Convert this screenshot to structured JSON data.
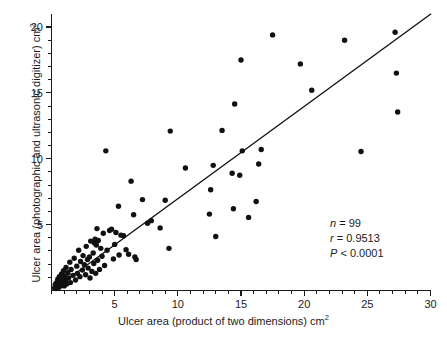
{
  "figure": {
    "width": 447,
    "height": 342,
    "background": "#ffffff",
    "ink_color": "#111111"
  },
  "labels": {
    "xlabel_main": "Ulcer area (product of two dimensions) cm",
    "xlabel_sup": "2",
    "ylabel_main": "Ulcer area (photographic and ultrasonic digitizer) cm",
    "ylabel_sup": "2"
  },
  "annotations": {
    "n_label": "n",
    "n_eq": " = 99",
    "r_label": "r",
    "r_eq": " = 0.9513",
    "p_label": "P",
    "p_eq": " < 0.0001"
  },
  "chart_data": {
    "type": "scatter",
    "title": "",
    "xlabel": "Ulcer area (product of two dimensions) cm2",
    "ylabel": "Ulcer area (photographic and ultrasonic digitizer) cm2",
    "xlim": [
      0,
      30
    ],
    "ylim": [
      0,
      21.2
    ],
    "xticks": [
      5,
      10,
      15,
      20,
      25,
      30
    ],
    "xticklabels": [
      "5",
      "10",
      "15",
      "20",
      "25",
      "30"
    ],
    "xminor_step": 1,
    "yticks": [
      5,
      10,
      15,
      20
    ],
    "yticklabels": [
      "5",
      "10",
      "15",
      "20"
    ],
    "yminor_step": 1,
    "grid": false,
    "legend": null,
    "n": 99,
    "r": 0.9513,
    "p_value": "< 0.0001",
    "marker": {
      "shape": "circle",
      "radius_px": 2.7,
      "color": "#111111"
    },
    "fit_line": {
      "type": "linear-regression",
      "x_start": 0.05,
      "y_start": 0.0,
      "x_end": 30.05,
      "y_end": 21.0,
      "slope": 0.699,
      "intercept": -0.035,
      "color": "#111111"
    },
    "points": [
      [
        0.25,
        0.2
      ],
      [
        0.3,
        0.45
      ],
      [
        0.35,
        0.15
      ],
      [
        0.4,
        0.6
      ],
      [
        0.45,
        0.3
      ],
      [
        0.5,
        0.85
      ],
      [
        0.55,
        0.5
      ],
      [
        0.6,
        0.25
      ],
      [
        0.62,
        1.05
      ],
      [
        0.7,
        0.7
      ],
      [
        0.75,
        0.4
      ],
      [
        0.8,
        1.25
      ],
      [
        0.85,
        0.9
      ],
      [
        0.9,
        0.55
      ],
      [
        0.95,
        1.5
      ],
      [
        1.0,
        0.35
      ],
      [
        1.05,
        1.1
      ],
      [
        1.1,
        0.75
      ],
      [
        1.15,
        1.75
      ],
      [
        1.2,
        0.5
      ],
      [
        1.3,
        1.35
      ],
      [
        1.35,
        0.95
      ],
      [
        1.45,
        2.15
      ],
      [
        1.5,
        0.6
      ],
      [
        1.55,
        1.6
      ],
      [
        1.7,
        1.15
      ],
      [
        1.8,
        2.45
      ],
      [
        1.9,
        0.8
      ],
      [
        2.0,
        1.85
      ],
      [
        2.05,
        1.3
      ],
      [
        2.15,
        3.05
      ],
      [
        2.25,
        1.05
      ],
      [
        2.3,
        2.2
      ],
      [
        2.45,
        1.55
      ],
      [
        2.5,
        2.65
      ],
      [
        2.6,
        1.95
      ],
      [
        2.7,
        1.2
      ],
      [
        2.75,
        3.35
      ],
      [
        2.85,
        2.35
      ],
      [
        2.9,
        1.7
      ],
      [
        3.0,
        2.55
      ],
      [
        3.05,
        0.95
      ],
      [
        3.1,
        3.75
      ],
      [
        3.2,
        1.45
      ],
      [
        3.3,
        2.85
      ],
      [
        3.35,
        2.05
      ],
      [
        3.4,
        3.6
      ],
      [
        3.45,
        3.9
      ],
      [
        3.5,
        1.3
      ],
      [
        3.55,
        3.45
      ],
      [
        3.6,
        4.7
      ],
      [
        3.65,
        2.3
      ],
      [
        3.7,
        3.8
      ],
      [
        3.8,
        1.6
      ],
      [
        3.9,
        3.2
      ],
      [
        4.0,
        2.6
      ],
      [
        4.1,
        4.35
      ],
      [
        4.2,
        1.9
      ],
      [
        4.3,
        10.6
      ],
      [
        4.4,
        3.05
      ],
      [
        4.6,
        4.55
      ],
      [
        4.75,
        4.65
      ],
      [
        4.9,
        2.4
      ],
      [
        5.0,
        3.5
      ],
      [
        5.1,
        4.4
      ],
      [
        5.3,
        6.4
      ],
      [
        5.35,
        2.7
      ],
      [
        5.5,
        4.2
      ],
      [
        5.7,
        4.15
      ],
      [
        5.9,
        3.1
      ],
      [
        6.1,
        2.75
      ],
      [
        6.3,
        8.3
      ],
      [
        6.5,
        5.75
      ],
      [
        6.6,
        2.55
      ],
      [
        6.7,
        2.35
      ],
      [
        7.2,
        6.9
      ],
      [
        7.6,
        5.1
      ],
      [
        7.9,
        5.3
      ],
      [
        8.6,
        4.75
      ],
      [
        9.0,
        6.85
      ],
      [
        9.3,
        3.2
      ],
      [
        9.4,
        12.1
      ],
      [
        10.6,
        9.3
      ],
      [
        12.5,
        5.8
      ],
      [
        12.6,
        7.65
      ],
      [
        12.8,
        9.5
      ],
      [
        13.0,
        4.1
      ],
      [
        13.5,
        12.15
      ],
      [
        14.3,
        8.9
      ],
      [
        14.4,
        6.2
      ],
      [
        14.5,
        14.15
      ],
      [
        14.9,
        8.75
      ],
      [
        15.0,
        17.5
      ],
      [
        15.1,
        10.6
      ],
      [
        15.6,
        5.55
      ],
      [
        16.2,
        6.75
      ],
      [
        16.4,
        9.6
      ],
      [
        16.6,
        10.7
      ],
      [
        17.5,
        19.4
      ],
      [
        19.7,
        17.2
      ],
      [
        20.6,
        15.2
      ],
      [
        23.2,
        19.0
      ],
      [
        24.5,
        10.55
      ],
      [
        27.2,
        19.6
      ],
      [
        27.3,
        16.5
      ],
      [
        27.4,
        13.55
      ]
    ]
  }
}
